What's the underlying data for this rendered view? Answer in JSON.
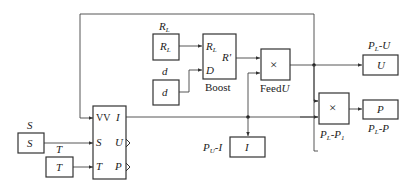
{
  "diagram": {
    "blocks": {
      "rl_source": {
        "inner": "R",
        "inner_sub": "L",
        "label": "R",
        "label_sub": "L"
      },
      "d_source": {
        "inner": "d",
        "label": "d"
      },
      "boost": {
        "port_rl": "R",
        "port_rl_sub": "L",
        "port_d": "D",
        "port_out": "R'",
        "caption": "Boost"
      },
      "feed_mult": {
        "symbol": "×",
        "caption_plain": "Feed",
        "caption_italic": "U"
      },
      "u_scope": {
        "inner": "U",
        "label_a": "P",
        "label_a_sub": "L",
        "label_b": "-U"
      },
      "p_mult": {
        "symbol": "×",
        "caption_a": "P",
        "caption_a_sub": "L",
        "caption_b": "-P",
        "caption_b_sub": "1"
      },
      "p_scope": {
        "inner": "P",
        "label_a": "P",
        "label_a_sub": "L",
        "label_b": "-P"
      },
      "i_scope": {
        "inner": "I",
        "label_a": "P",
        "label_a_sub": "U",
        "label_b": "-I"
      },
      "s_source": {
        "inner": "S",
        "label": "S"
      },
      "t_source": {
        "inner": "T",
        "label": "T"
      },
      "pv": {
        "port_vv": "VV",
        "port_s": "S",
        "port_t": "T",
        "port_i": "I",
        "port_u": "U",
        "port_p": "P"
      }
    }
  }
}
